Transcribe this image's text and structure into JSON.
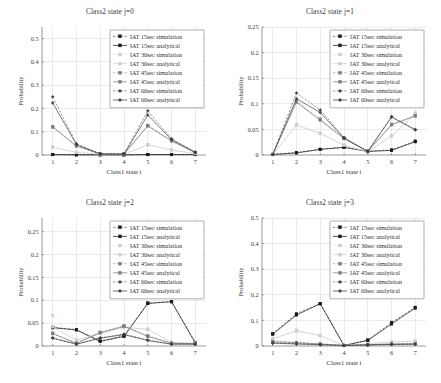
{
  "figure": {
    "background": "#ffffff",
    "width": 441,
    "height": 383,
    "panel_count": 4
  },
  "legend": {
    "entries": [
      {
        "label": "IAT 15sec simulation",
        "color": "#1a1a1a",
        "dash": "dashed",
        "marker": "square",
        "key": "iat15_sim"
      },
      {
        "label": "IAT 15sec analytical",
        "color": "#1a1a1a",
        "dash": "solid",
        "marker": "square",
        "key": "iat15_ana"
      },
      {
        "label": "IAT 30sec simulation",
        "color": "#cfcfcf",
        "dash": "dashed",
        "marker": "square",
        "key": "iat30_sim"
      },
      {
        "label": "IAT 30sec analytical",
        "color": "#cfcfcf",
        "dash": "solid",
        "marker": "square",
        "key": "iat30_ana"
      },
      {
        "label": "IAT 45sec simulation",
        "color": "#7d7d7d",
        "dash": "dashed",
        "marker": "square",
        "key": "iat45_sim"
      },
      {
        "label": "IAT 45sec analytical",
        "color": "#7d7d7d",
        "dash": "solid",
        "marker": "square",
        "key": "iat45_ana"
      },
      {
        "label": "IAT 60sec simulation",
        "color": "#3f3f3f",
        "dash": "dashed",
        "marker": "diamond",
        "key": "iat60_sim"
      },
      {
        "label": "IAT 60sec analytical",
        "color": "#3f3f3f",
        "dash": "solid",
        "marker": "diamond",
        "key": "iat60_ana"
      }
    ]
  },
  "chart_data": [
    {
      "type": "line",
      "panel_index": 0,
      "title": "Class2 state j=0",
      "xlabel": "Class1 state i",
      "ylabel": "Probability",
      "categories": [
        1,
        2,
        3,
        4,
        5,
        6,
        7
      ],
      "x": [
        1,
        2,
        3,
        4,
        5,
        6,
        7
      ],
      "xlim": [
        0.55,
        7.45
      ],
      "ylim": [
        0,
        0.55
      ],
      "yticks": [
        0,
        0.1,
        0.2,
        0.3,
        0.4,
        0.5
      ],
      "ytick_labels": [
        "0",
        "0.1",
        "0.2",
        "0.3",
        "0.4",
        "0.5"
      ],
      "xticks": [
        1,
        2,
        3,
        4,
        5,
        6,
        7
      ],
      "xtick_labels": [
        "1",
        "2",
        "3",
        "4",
        "5",
        "6",
        "7"
      ],
      "grid": true,
      "legend_position": "upper right",
      "series": [
        {
          "name": "IAT 15sec simulation",
          "key": "iat15_sim",
          "values": [
            0.002,
            0.001,
            0.001,
            0.001,
            0.002,
            0.002,
            0.002
          ]
        },
        {
          "name": "IAT 15sec analytical",
          "key": "iat15_ana",
          "values": [
            0.002,
            0.001,
            0.001,
            0.001,
            0.002,
            0.002,
            0.002
          ]
        },
        {
          "name": "IAT 30sec simulation",
          "key": "iat30_sim",
          "values": [
            0.035,
            0.012,
            0.004,
            0.004,
            0.045,
            0.022,
            0.006
          ]
        },
        {
          "name": "IAT 30sec analytical",
          "key": "iat30_ana",
          "values": [
            0.033,
            0.011,
            0.004,
            0.004,
            0.043,
            0.021,
            0.006
          ]
        },
        {
          "name": "IAT 45sec simulation",
          "key": "iat45_sim",
          "values": [
            0.122,
            0.04,
            0.004,
            0.004,
            0.127,
            0.062,
            0.01
          ]
        },
        {
          "name": "IAT 45sec analytical",
          "key": "iat45_ana",
          "values": [
            0.12,
            0.038,
            0.004,
            0.004,
            0.125,
            0.06,
            0.01
          ]
        },
        {
          "name": "IAT 60sec simulation",
          "key": "iat60_sim",
          "values": [
            0.25,
            0.048,
            0.005,
            0.004,
            0.19,
            0.07,
            0.012
          ]
        },
        {
          "name": "IAT 60sec analytical",
          "key": "iat60_ana",
          "values": [
            0.224,
            0.045,
            0.005,
            0.004,
            0.172,
            0.066,
            0.012
          ]
        }
      ]
    },
    {
      "type": "line",
      "panel_index": 1,
      "title": "Class2 state j=1",
      "xlabel": "Class1 state i",
      "ylabel": "Probability",
      "categories": [
        1,
        2,
        3,
        4,
        5,
        6,
        7
      ],
      "x": [
        1,
        2,
        3,
        4,
        5,
        6,
        7
      ],
      "xlim": [
        0.55,
        7.45
      ],
      "ylim": [
        0,
        0.25
      ],
      "yticks": [
        0,
        0.05,
        0.1,
        0.15,
        0.2,
        0.25
      ],
      "ytick_labels": [
        "0",
        "0.05",
        "0.1",
        "0.15",
        "0.2",
        "0.25"
      ],
      "xticks": [
        1,
        2,
        3,
        4,
        5,
        6,
        7
      ],
      "xtick_labels": [
        "1",
        "2",
        "3",
        "4",
        "5",
        "6",
        "7"
      ],
      "grid": true,
      "legend_position": "upper right",
      "series": [
        {
          "name": "IAT 15sec simulation",
          "key": "iat15_sim",
          "values": [
            0.001,
            0.005,
            0.011,
            0.015,
            0.007,
            0.01,
            0.027
          ]
        },
        {
          "name": "IAT 15sec analytical",
          "key": "iat15_ana",
          "values": [
            0.001,
            0.004,
            0.011,
            0.015,
            0.007,
            0.009,
            0.026
          ]
        },
        {
          "name": "IAT 30sec simulation",
          "key": "iat30_sim",
          "values": [
            0.001,
            0.06,
            0.043,
            0.02,
            0.006,
            0.038,
            0.082
          ]
        },
        {
          "name": "IAT 30sec analytical",
          "key": "iat30_ana",
          "values": [
            0.001,
            0.058,
            0.042,
            0.019,
            0.006,
            0.037,
            0.08
          ]
        },
        {
          "name": "IAT 45sec simulation",
          "key": "iat45_sim",
          "values": [
            0.001,
            0.105,
            0.07,
            0.033,
            0.007,
            0.06,
            0.077
          ]
        },
        {
          "name": "IAT 45sec analytical",
          "key": "iat45_ana",
          "values": [
            0.001,
            0.103,
            0.068,
            0.032,
            0.007,
            0.059,
            0.076
          ]
        },
        {
          "name": "IAT 60sec simulation",
          "key": "iat60_sim",
          "values": [
            0.001,
            0.121,
            0.088,
            0.034,
            0.007,
            0.075,
            0.05
          ]
        },
        {
          "name": "IAT 60sec analytical",
          "key": "iat60_ana",
          "values": [
            0.001,
            0.11,
            0.083,
            0.033,
            0.007,
            0.074,
            0.049
          ]
        }
      ]
    },
    {
      "type": "line",
      "panel_index": 2,
      "title": "Class2 state j=2",
      "xlabel": "Class1 state i",
      "ylabel": "Probability",
      "categories": [
        1,
        2,
        3,
        4,
        5,
        6,
        7
      ],
      "x": [
        1,
        2,
        3,
        4,
        5,
        6,
        7
      ],
      "xlim": [
        0.55,
        7.45
      ],
      "ylim": [
        0,
        0.28
      ],
      "yticks": [
        0,
        0.05,
        0.1,
        0.15,
        0.2,
        0.25
      ],
      "ytick_labels": [
        "0",
        "0.05",
        "0.1",
        "0.15",
        "0.2",
        "0.25"
      ],
      "xticks": [
        1,
        2,
        3,
        4,
        5,
        6,
        7
      ],
      "xtick_labels": [
        "1",
        "2",
        "3",
        "4",
        "5",
        "6",
        "7"
      ],
      "grid": true,
      "legend_position": "upper right",
      "series": [
        {
          "name": "IAT 15sec simulation",
          "key": "iat15_sim",
          "values": [
            0.041,
            0.036,
            0.011,
            0.022,
            0.094,
            0.097,
            0.007
          ]
        },
        {
          "name": "IAT 15sec analytical",
          "key": "iat15_ana",
          "values": [
            0.04,
            0.035,
            0.01,
            0.021,
            0.093,
            0.097,
            0.007
          ]
        },
        {
          "name": "IAT 30sec simulation",
          "key": "iat30_sim",
          "values": [
            0.067,
            0.013,
            0.028,
            0.042,
            0.037,
            0.008,
            0.006
          ]
        },
        {
          "name": "IAT 30sec analytical",
          "key": "iat30_ana",
          "values": [
            0.042,
            0.012,
            0.027,
            0.041,
            0.036,
            0.008,
            0.006
          ]
        },
        {
          "name": "IAT 45sec simulation",
          "key": "iat45_sim",
          "values": [
            0.028,
            0.006,
            0.03,
            0.044,
            0.022,
            0.006,
            0.005
          ]
        },
        {
          "name": "IAT 45sec analytical",
          "key": "iat45_ana",
          "values": [
            0.027,
            0.006,
            0.029,
            0.043,
            0.021,
            0.006,
            0.005
          ]
        },
        {
          "name": "IAT 60sec simulation",
          "key": "iat60_sim",
          "values": [
            0.018,
            0.004,
            0.018,
            0.026,
            0.013,
            0.004,
            0.004
          ]
        },
        {
          "name": "IAT 60sec analytical",
          "key": "iat60_ana",
          "values": [
            0.017,
            0.004,
            0.017,
            0.025,
            0.012,
            0.004,
            0.004
          ]
        }
      ]
    },
    {
      "type": "line",
      "panel_index": 3,
      "title": "Class2 state j=3",
      "xlabel": "Class1 state i",
      "ylabel": "Probability",
      "categories": [
        1,
        2,
        3,
        4,
        5,
        6,
        7
      ],
      "x": [
        1,
        2,
        3,
        4,
        5,
        6,
        7
      ],
      "xlim": [
        0.55,
        7.45
      ],
      "ylim": [
        0,
        0.5
      ],
      "yticks": [
        0,
        0.1,
        0.2,
        0.3,
        0.4,
        0.5
      ],
      "ytick_labels": [
        "0",
        "0.1",
        "0.2",
        "0.3",
        "0.4",
        "0.5"
      ],
      "xticks": [
        1,
        2,
        3,
        4,
        5,
        6,
        7
      ],
      "xtick_labels": [
        "1",
        "2",
        "3",
        "4",
        "5",
        "6",
        "7"
      ],
      "grid": true,
      "legend_position": "upper right",
      "series": [
        {
          "name": "IAT 15sec simulation",
          "key": "iat15_sim",
          "values": [
            0.048,
            0.126,
            0.166,
            0.002,
            0.023,
            0.092,
            0.151
          ]
        },
        {
          "name": "IAT 15sec analytical",
          "key": "iat15_ana",
          "values": [
            0.046,
            0.121,
            0.165,
            0.002,
            0.022,
            0.086,
            0.148
          ]
        },
        {
          "name": "IAT 30sec simulation",
          "key": "iat30_sim",
          "values": [
            0.03,
            0.062,
            0.042,
            0.002,
            0.008,
            0.017,
            0.02
          ]
        },
        {
          "name": "IAT 30sec analytical",
          "key": "iat30_ana",
          "values": [
            0.028,
            0.058,
            0.04,
            0.002,
            0.008,
            0.016,
            0.019
          ]
        },
        {
          "name": "IAT 45sec simulation",
          "key": "iat45_sim",
          "values": [
            0.018,
            0.014,
            0.008,
            0.002,
            0.005,
            0.008,
            0.009
          ]
        },
        {
          "name": "IAT 45sec analytical",
          "key": "iat45_ana",
          "values": [
            0.017,
            0.013,
            0.008,
            0.002,
            0.005,
            0.008,
            0.009
          ]
        },
        {
          "name": "IAT 60sec simulation",
          "key": "iat60_sim",
          "values": [
            0.012,
            0.009,
            0.005,
            0.002,
            0.004,
            0.006,
            0.007
          ]
        },
        {
          "name": "IAT 60sec analytical",
          "key": "iat60_ana",
          "values": [
            0.011,
            0.008,
            0.005,
            0.002,
            0.004,
            0.006,
            0.007
          ]
        }
      ]
    }
  ]
}
